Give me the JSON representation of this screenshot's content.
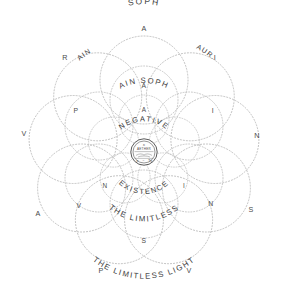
{
  "diagram": {
    "title": "Negative Existence",
    "background_color": "#ffffff",
    "stroke_color": "#b9b9b9",
    "text_color": "#3c3c3c",
    "center": {
      "cx": 144,
      "cy": 152
    },
    "rings": {
      "outer": {
        "name": "ain-soph-aur-ring",
        "petal_count": 9,
        "petal_radius": 44,
        "orbit_radius": 72,
        "letters": [
          {
            "char": "A",
            "angle": -90,
            "label": "outer-letter-a-top"
          },
          {
            "char": "I",
            "angle": -50,
            "label": "outer-letter-i"
          },
          {
            "char": "N",
            "angle": -10,
            "label": "outer-letter-n"
          },
          {
            "char": "S",
            "angle": 30,
            "label": "outer-letter-s"
          },
          {
            "char": "V",
            "angle": 70,
            "label": "outer-letter-v-lower-right"
          },
          {
            "char": "P",
            "angle": 110,
            "label": "outer-letter-p"
          },
          {
            "char": "A",
            "angle": 150,
            "label": "outer-letter-a-lower-left"
          },
          {
            "char": "V",
            "angle": 190,
            "label": "outer-letter-v-left"
          },
          {
            "char": "R",
            "angle": 230,
            "label": "outer-letter-r"
          }
        ],
        "arc_labels": [
          {
            "text": "SOPH",
            "label": "outer-arc-soph"
          },
          {
            "text": "AIN",
            "label": "outer-arc-ain"
          },
          {
            "text": "AUR.",
            "label": "outer-arc-aur"
          }
        ]
      },
      "middle": {
        "name": "ain-soph-ring",
        "petal_count": 6,
        "petal_radius": 34,
        "orbit_radius": 52,
        "letters": [
          {
            "char": "A",
            "angle": -90,
            "label": "middle-letter-a-top"
          },
          {
            "char": "I",
            "angle": -30,
            "label": "middle-letter-i"
          },
          {
            "char": "N",
            "angle": 30,
            "label": "middle-letter-n"
          },
          {
            "char": "S",
            "angle": 90,
            "label": "middle-letter-s"
          },
          {
            "char": "V",
            "angle": 150,
            "label": "middle-letter-v"
          },
          {
            "char": "P",
            "angle": 210,
            "label": "middle-letter-p"
          }
        ],
        "arc_labels": [
          {
            "text": "AIN SOPH",
            "label": "middle-arc-ain-soph"
          },
          {
            "text": "THE LIMITLESS",
            "label": "middle-arc-the-limitless"
          },
          {
            "text": "THE LIMITLESS LIGHT",
            "label": "middle-arc-the-limitless-light"
          }
        ]
      },
      "inner": {
        "name": "ain-ring",
        "petal_count": 5,
        "petal_radius": 25,
        "orbit_radius": 32,
        "letters": [
          {
            "char": "A",
            "angle": -90,
            "label": "inner-letter-a-top"
          },
          {
            "char": "I",
            "angle": 34,
            "label": "inner-letter-i"
          },
          {
            "char": "N",
            "angle": 146,
            "label": "inner-letter-n"
          }
        ],
        "arc_labels": [
          {
            "text": "NEGATIVE",
            "label": "inner-arc-negative"
          },
          {
            "text": "EXISTENCE",
            "label": "inner-arc-existence"
          }
        ]
      }
    },
    "emblem": {
      "name": "aether-seal",
      "radius": 14,
      "top_glyph": "א",
      "label": "AETHER",
      "bottom_left_glyph": "א",
      "bottom_mid_glyph": "=",
      "bottom_right_glyph": "Tא"
    }
  }
}
